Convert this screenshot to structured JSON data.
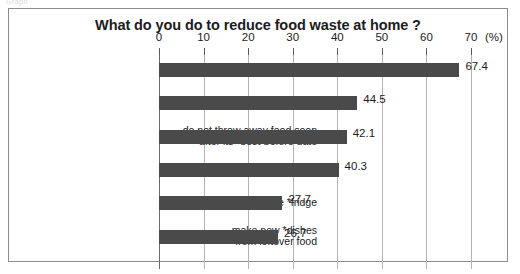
{
  "scan_artifact": "Graph",
  "chart_data": {
    "type": "bar",
    "orientation": "horizontal",
    "title": "What do you do to reduce food waste at home ?",
    "xlabel": "",
    "ylabel": "",
    "unit_label": "(%)",
    "xlim": [
      0,
      70
    ],
    "xticks": [
      0,
      10,
      20,
      30,
      40,
      50,
      60,
      70
    ],
    "xtick_labels": [
      "0",
      "10",
      "20",
      "30",
      "40",
      "50",
      "60",
      "70"
    ],
    "grid": true,
    "legend": false,
    "bar_color": "#4a4a4a",
    "categories": [
      "eat all the food on my *plate",
      "use the *freezer",
      "do not throw away food soon\nafter its *best-before date",
      "only cook the food I will eat",
      "know what is in the *fridge",
      "make new *dishes\nfrom leftover food"
    ],
    "values": [
      67.4,
      44.5,
      42.1,
      40.3,
      27.7,
      26.7
    ],
    "value_labels": [
      "67.4",
      "44.5",
      "42.1",
      "40.3",
      "27.7",
      "26.7"
    ]
  }
}
